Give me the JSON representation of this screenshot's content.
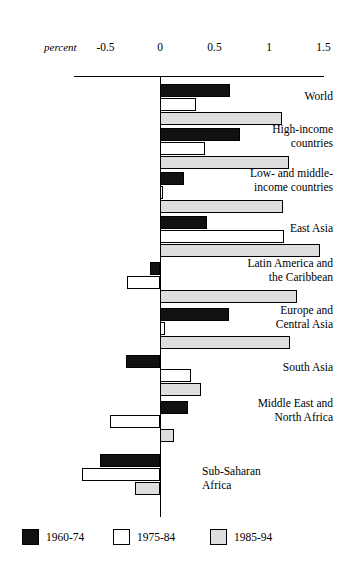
{
  "chart_data": {
    "type": "bar",
    "orientation": "horizontal",
    "title": "",
    "xlabel": "percent",
    "ylabel": "",
    "xlim": [
      -0.85,
      1.6
    ],
    "grid": false,
    "legend_position": "bottom",
    "axis_unit_label": "percent",
    "tick_labels": [
      "-0.5",
      "0",
      "0.5",
      "1",
      "1.5"
    ],
    "tick_values": [
      -0.5,
      0,
      0.5,
      1,
      1.5
    ],
    "categories": [
      "World",
      "High-income\ncountries",
      "Low- and middle-\nincome countries",
      "East Asia",
      "Latin America and\nthe Caribbean",
      "Europe and\nCentral Asia",
      "South Asia",
      "Middle East and\nNorth Africa",
      "Sub-Saharan\nAfrica"
    ],
    "series": [
      {
        "name": "1960-74",
        "color": "#111111",
        "values": [
          0.64,
          0.73,
          0.22,
          0.43,
          -0.09,
          0.63,
          -0.31,
          0.26,
          -0.55
        ]
      },
      {
        "name": "1975-84",
        "color": "#ffffff",
        "values": [
          0.33,
          0.41,
          0.03,
          1.14,
          -0.3,
          0.05,
          0.28,
          -0.46,
          -0.72
        ]
      },
      {
        "name": "1985-94",
        "color": "#dedede",
        "values": [
          1.12,
          1.18,
          1.13,
          1.47,
          1.26,
          1.19,
          0.38,
          0.13,
          -0.23
        ]
      }
    ]
  },
  "legend": {
    "items": [
      {
        "label": "1960-74",
        "swatch": "black-filled-square"
      },
      {
        "label": "1975-84",
        "swatch": "white-outlined-square"
      },
      {
        "label": "1985-94",
        "swatch": "gray-filled-square"
      }
    ]
  }
}
